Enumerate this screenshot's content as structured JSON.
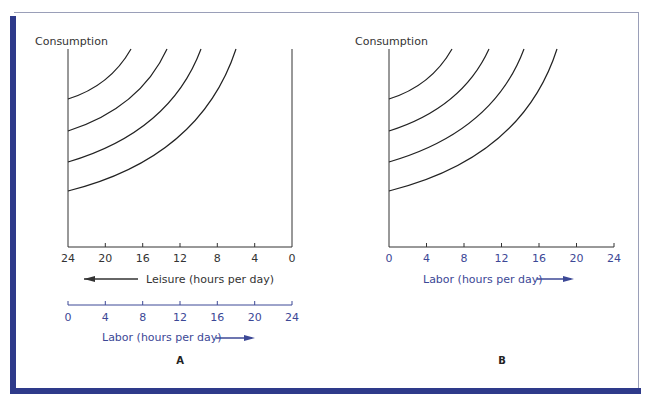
{
  "colors": {
    "frame_accent": "#2e3a8a",
    "frame_border": "#9a9fb8",
    "axis_black": "#333333",
    "labor_blue": "#3c4896"
  },
  "panels": [
    {
      "id": "A",
      "caption": "A",
      "y_label": "Consumption",
      "x_axis_top": {
        "label": "Leisure (hours per day)",
        "arrow": "left-arrow",
        "ticks": [
          "24",
          "20",
          "16",
          "12",
          "8",
          "4",
          "0"
        ]
      },
      "x_axis_bottom": {
        "label": "Labor (hours per day)",
        "arrow": "right-arrow",
        "ticks": [
          "0",
          "4",
          "8",
          "12",
          "16",
          "20",
          "24"
        ]
      },
      "curves": 4
    },
    {
      "id": "B",
      "caption": "B",
      "y_label": "Consumption",
      "x_axis": {
        "label": "Labor (hours per day)",
        "arrow": "right-arrow",
        "ticks": [
          "0",
          "4",
          "8",
          "12",
          "16",
          "20",
          "24"
        ]
      },
      "curves": 4
    }
  ]
}
